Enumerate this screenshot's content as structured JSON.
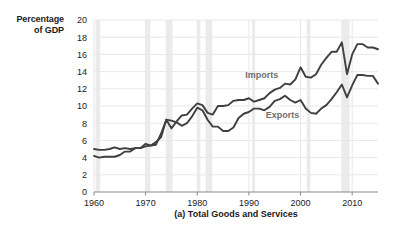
{
  "figure": {
    "y_axis_title_line1": "Percentage",
    "y_axis_title_line2": "of GDP",
    "caption": "(a) Total Goods and Services"
  },
  "chart_data": {
    "type": "line",
    "title": "(a) Total Goods and Services",
    "xlabel": "",
    "ylabel": "Percentage of GDP",
    "xlim": [
      1960,
      2015
    ],
    "ylim": [
      0,
      20
    ],
    "xticks": [
      1960,
      1970,
      1980,
      1990,
      2000,
      2010
    ],
    "yticks": [
      0,
      2,
      4,
      6,
      8,
      10,
      12,
      14,
      16,
      18,
      20
    ],
    "grid": true,
    "legend": "inline-annotations",
    "line_color": "#3f3f3f",
    "grid_color": "#e8e8e8",
    "recession_band_color": "#ebebeb",
    "annotations": [
      {
        "text": "Imports",
        "x": 1992.5,
        "y": 13.2
      },
      {
        "text": "Exports",
        "x": 1996.5,
        "y": 8.6
      }
    ],
    "recession_bands": [
      [
        1960.3,
        1961.2
      ],
      [
        1969.9,
        1970.9
      ],
      [
        1973.9,
        1975.2
      ],
      [
        1980.0,
        1980.6
      ],
      [
        1981.6,
        1982.9
      ],
      [
        1990.6,
        1991.2
      ],
      [
        2001.2,
        2001.9
      ],
      [
        2007.9,
        2009.5
      ]
    ],
    "x": [
      1960,
      1961,
      1962,
      1963,
      1964,
      1965,
      1966,
      1967,
      1968,
      1969,
      1970,
      1971,
      1972,
      1973,
      1974,
      1975,
      1976,
      1977,
      1978,
      1979,
      1980,
      1981,
      1982,
      1983,
      1984,
      1985,
      1986,
      1987,
      1988,
      1989,
      1990,
      1991,
      1992,
      1993,
      1994,
      1995,
      1996,
      1997,
      1998,
      1999,
      2000,
      2001,
      2002,
      2003,
      2004,
      2005,
      2006,
      2007,
      2008,
      2009,
      2010,
      2011,
      2012,
      2013,
      2014,
      2015
    ],
    "series": [
      {
        "name": "Imports",
        "values": [
          4.2,
          4.0,
          4.1,
          4.1,
          4.1,
          4.3,
          4.7,
          4.7,
          5.1,
          5.1,
          5.3,
          5.4,
          5.8,
          6.4,
          8.4,
          7.4,
          8.2,
          8.9,
          9.0,
          9.7,
          10.3,
          10.1,
          9.2,
          9.0,
          10.0,
          10.0,
          10.1,
          10.6,
          10.7,
          10.7,
          10.9,
          10.5,
          10.7,
          10.9,
          11.5,
          11.9,
          12.1,
          12.6,
          12.5,
          13.1,
          14.5,
          13.4,
          13.3,
          13.7,
          14.8,
          15.6,
          16.3,
          16.3,
          17.4,
          13.7,
          16.0,
          17.2,
          17.2,
          16.8,
          16.8,
          16.6
        ]
      },
      {
        "name": "Exports",
        "values": [
          5.0,
          4.9,
          4.9,
          5.0,
          5.2,
          5.0,
          5.1,
          5.0,
          5.1,
          5.1,
          5.6,
          5.4,
          5.5,
          6.8,
          8.4,
          8.3,
          8.1,
          7.7,
          8.0,
          8.8,
          9.8,
          9.5,
          8.4,
          7.6,
          7.6,
          7.1,
          7.1,
          7.5,
          8.6,
          9.1,
          9.3,
          9.7,
          9.7,
          9.5,
          9.9,
          10.6,
          10.8,
          11.2,
          10.7,
          10.4,
          10.7,
          9.7,
          9.2,
          9.1,
          9.7,
          10.1,
          10.8,
          11.6,
          12.5,
          11.0,
          12.4,
          13.6,
          13.6,
          13.5,
          13.5,
          12.6
        ]
      }
    ]
  }
}
